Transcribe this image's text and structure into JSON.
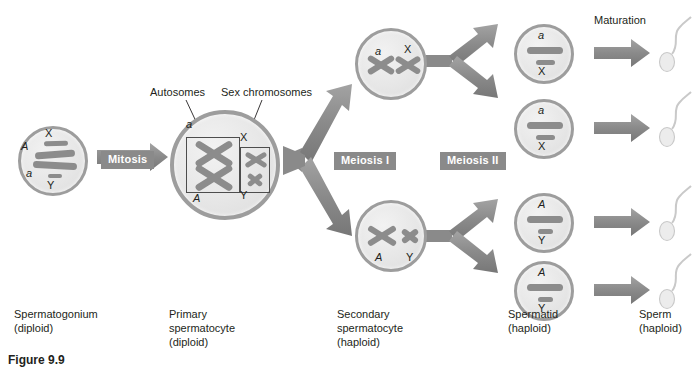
{
  "figure": {
    "title_caption": "Figure 9.9",
    "process_labels": {
      "mitosis": "Mitosis",
      "meiosis_1": "Meiosis I",
      "meiosis_2": "Meiosis II",
      "maturation": "Maturation"
    },
    "callouts": {
      "autosomes": "Autosomes",
      "sex_chromosomes": "Sex chromosomes"
    },
    "stage_captions": [
      {
        "name": "Spermatogonium",
        "ploidy": "(diploid)"
      },
      {
        "name": "Primary",
        "name2": "spermatocyte",
        "ploidy": "(diploid)"
      },
      {
        "name": "Secondary",
        "name2": "spermatocyte",
        "ploidy": "(haploid)"
      },
      {
        "name": "Spermatid",
        "ploidy": "(haploid)"
      },
      {
        "name": "Sperm",
        "ploidy": "(haploid)"
      }
    ],
    "cells": {
      "spermatogonium": {
        "labels": {
          "autosome_upper": "A",
          "autosome_lower": "a",
          "sex_upper": "X",
          "sex_lower": "Y"
        }
      },
      "primary_spermatocyte": {
        "labels": {
          "autosome_upper": "a",
          "autosome_lower": "A",
          "sex_upper": "X",
          "sex_lower": "Y"
        }
      },
      "secondary_spermatocyte_top": {
        "labels": {
          "autosome": "a",
          "sex": "X"
        }
      },
      "secondary_spermatocyte_bottom": {
        "labels": {
          "autosome": "A",
          "sex": "Y"
        }
      },
      "spermatids": [
        {
          "autosome": "a",
          "sex": "X"
        },
        {
          "autosome": "a",
          "sex": "X"
        },
        {
          "autosome": "A",
          "sex": "Y"
        },
        {
          "autosome": "A",
          "sex": "Y"
        }
      ]
    },
    "colors": {
      "cell_border": "#9d9d9d",
      "cell_fill": "#e6e6e6",
      "chromosome": "#8c8c8c",
      "arrow": "#8a8a8a",
      "chip_bg": "#8a8a8a",
      "chip_text": "#ffffff",
      "text": "#231f20",
      "sperm": "#d6d6d6"
    }
  }
}
